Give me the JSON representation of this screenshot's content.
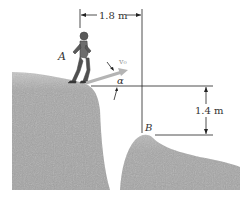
{
  "figure": {
    "point_a_label": "A",
    "point_b_label": "B",
    "velocity_label": "v₀",
    "angle_label": "α",
    "horizontal_distance": "1.8 m",
    "vertical_distance": "1.4 m"
  },
  "colors": {
    "terrain": "#a9a9a9",
    "arrow": "#b4b4b4",
    "lines": "#222222"
  }
}
